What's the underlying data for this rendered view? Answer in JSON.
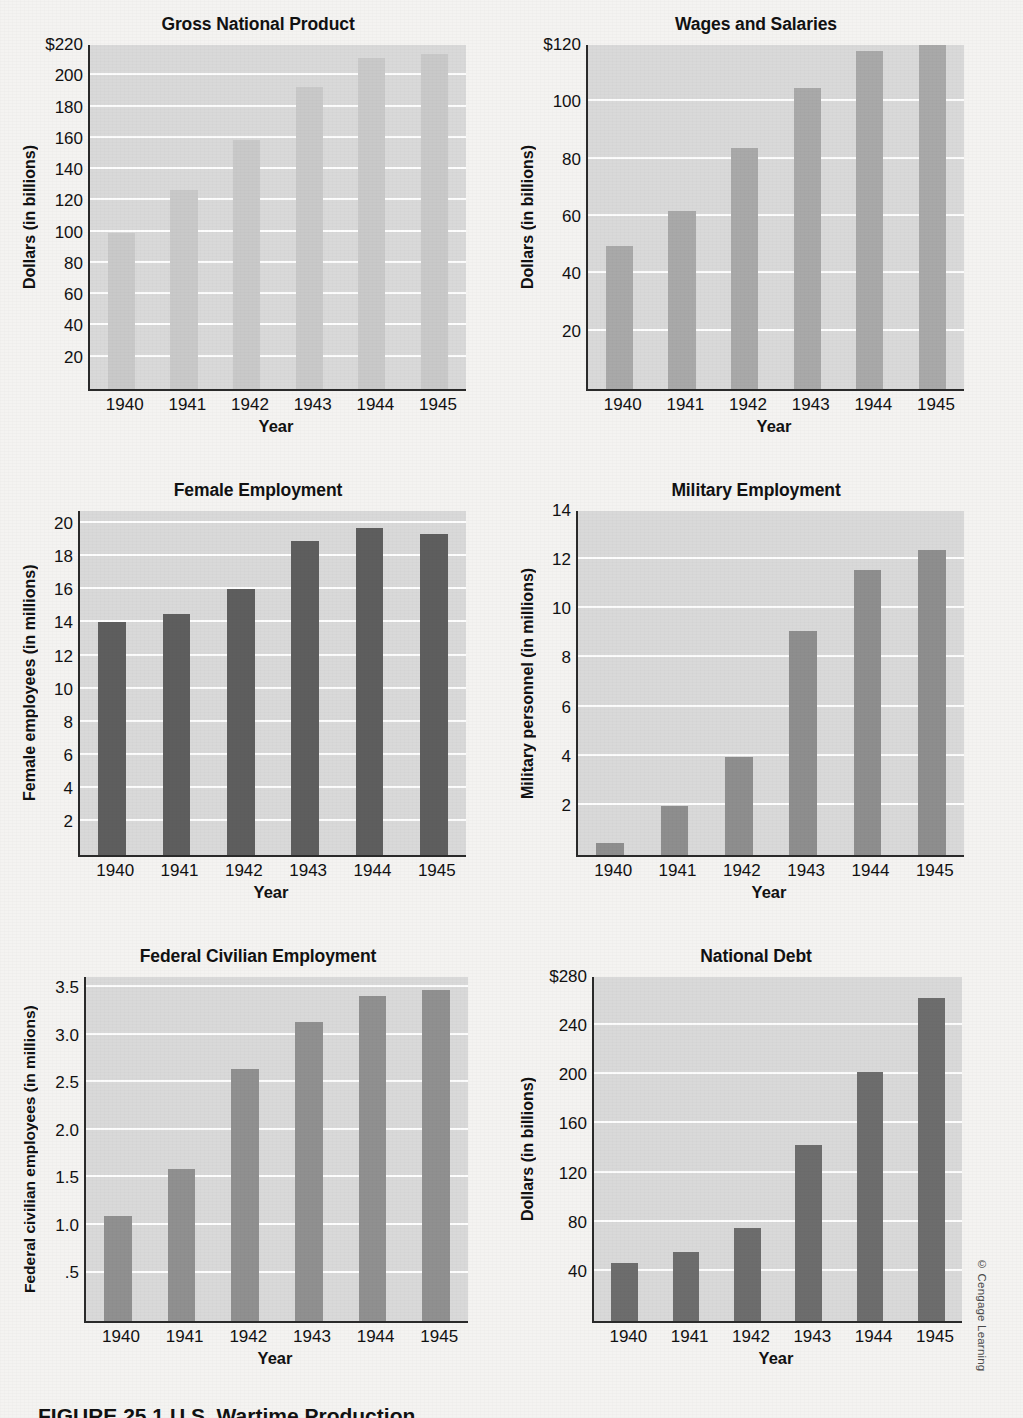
{
  "figure": {
    "caption": "FIGURE 25.1   U.S. Wartime Production",
    "credit": "© Cengage Learning",
    "categories": [
      "1940",
      "1941",
      "1942",
      "1943",
      "1944",
      "1945"
    ],
    "xlabel": "Year"
  },
  "chart_data": [
    {
      "type": "bar",
      "id": "gross-national-product",
      "title": "Gross National Product",
      "xlabel": "Year",
      "ylabel": "Dollars (in billions)",
      "categories": [
        "1940",
        "1941",
        "1942",
        "1943",
        "1944",
        "1945"
      ],
      "values": [
        100,
        127,
        159,
        193,
        212,
        214
      ],
      "ylim": [
        0,
        220
      ],
      "yticks": [
        220,
        200,
        180,
        160,
        140,
        120,
        100,
        80,
        60,
        40,
        20
      ],
      "ytick_labels": [
        "$220",
        "200",
        "180",
        "160",
        "140",
        "120",
        "100",
        "80",
        "60",
        "40",
        "20"
      ],
      "bar_color": "#c9c9c9",
      "plot_bg": "#d9d9d9",
      "grid": true
    },
    {
      "type": "bar",
      "id": "wages-and-salaries",
      "title": "Wages and Salaries",
      "xlabel": "Year",
      "ylabel": "Dollars (in billions)",
      "categories": [
        "1940",
        "1941",
        "1942",
        "1943",
        "1944",
        "1945"
      ],
      "values": [
        50,
        62,
        84,
        105,
        118,
        120
      ],
      "ylim": [
        0,
        120
      ],
      "yticks": [
        120,
        100,
        80,
        60,
        40,
        20
      ],
      "ytick_labels": [
        "$120",
        "100",
        "80",
        "60",
        "40",
        "20"
      ],
      "bar_color": "#a9a9a9",
      "plot_bg": "#d9d9d9",
      "grid": true
    },
    {
      "type": "bar",
      "id": "female-employment",
      "title": "Female Employment",
      "xlabel": "Year",
      "ylabel": "Female employees (in millions)",
      "categories": [
        "1940",
        "1941",
        "1942",
        "1943",
        "1944",
        "1945"
      ],
      "values": [
        14.1,
        14.6,
        16.1,
        19.0,
        19.8,
        19.4
      ],
      "ylim": [
        0,
        20.8
      ],
      "yticks": [
        20,
        18,
        16,
        14,
        12,
        10,
        8,
        6,
        4,
        2
      ],
      "ytick_labels": [
        "20",
        "18",
        "16",
        "14",
        "12",
        "10",
        "8",
        "6",
        "4",
        "2"
      ],
      "bar_color": "#5e5e5e",
      "plot_bg": "#d9d9d9",
      "grid": true
    },
    {
      "type": "bar",
      "id": "military-employment",
      "title": "Military Employment",
      "xlabel": "Year",
      "ylabel": "Military personnel (in millions)",
      "categories": [
        "1940",
        "1941",
        "1942",
        "1943",
        "1944",
        "1945"
      ],
      "values": [
        0.5,
        2.0,
        4.0,
        9.1,
        11.6,
        12.4
      ],
      "ylim": [
        0,
        14
      ],
      "yticks": [
        14,
        12,
        10,
        8,
        6,
        4,
        2
      ],
      "ytick_labels": [
        "14",
        "12",
        "10",
        "8",
        "6",
        "4",
        "2"
      ],
      "bar_color": "#8e8e8e",
      "plot_bg": "#d9d9d9",
      "grid": true
    },
    {
      "type": "bar",
      "id": "federal-civilian-employment",
      "title": "Federal Civilian Employment",
      "xlabel": "Year",
      "ylabel": "Federal civilian employees (in millions)",
      "categories": [
        "1940",
        "1941",
        "1942",
        "1943",
        "1944",
        "1945"
      ],
      "values": [
        1.1,
        1.6,
        2.65,
        3.15,
        3.42,
        3.48
      ],
      "ylim": [
        0,
        3.62
      ],
      "yticks": [
        3.5,
        3.0,
        2.5,
        2.0,
        1.5,
        1.0,
        0.5
      ],
      "ytick_labels": [
        "3.5",
        "3.0",
        "2.5",
        "2.0",
        "1.5",
        "1.0",
        ".5"
      ],
      "bar_color": "#909090",
      "plot_bg": "#d9d9d9",
      "grid": true
    },
    {
      "type": "bar",
      "id": "national-debt",
      "title": "National Debt",
      "xlabel": "Year",
      "ylabel": "Dollars (in billions)",
      "categories": [
        "1940",
        "1941",
        "1942",
        "1943",
        "1944",
        "1945"
      ],
      "values": [
        47,
        56,
        76,
        143,
        203,
        263
      ],
      "ylim": [
        0,
        280
      ],
      "yticks": [
        280,
        240,
        200,
        160,
        120,
        80,
        40
      ],
      "ytick_labels": [
        "$280",
        "240",
        "200",
        "160",
        "120",
        "80",
        "40"
      ],
      "bar_color": "#6d6d6d",
      "plot_bg": "#d9d9d9",
      "grid": true
    }
  ]
}
